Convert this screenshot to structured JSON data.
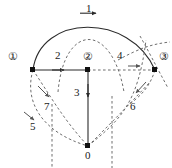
{
  "diagram": {
    "type": "directed-graph",
    "background": "#ffffff",
    "stroke_solid": "#2b2b2b",
    "stroke_dashed": "#6e6e6e",
    "nodes": [
      {
        "id": "n1",
        "label": "①",
        "circled": true,
        "x": 33,
        "y": 70,
        "label_x": 8,
        "label_y": 51
      },
      {
        "id": "n2",
        "label": "②",
        "circled": true,
        "x": 88,
        "y": 70,
        "label_x": 83,
        "label_y": 51
      },
      {
        "id": "n3",
        "label": "③",
        "circled": true,
        "x": 155,
        "y": 70,
        "label_x": 159,
        "label_y": 51
      },
      {
        "id": "n0",
        "label": "0",
        "circled": false,
        "x": 88,
        "y": 146,
        "label_x": 85,
        "label_y": 150
      }
    ],
    "edge_labels": [
      {
        "id": "e1",
        "text": "1",
        "x": 86,
        "y": 3,
        "style": "solid"
      },
      {
        "id": "e2",
        "text": "2",
        "x": 55,
        "y": 50,
        "style": "solid"
      },
      {
        "id": "e3",
        "text": "3",
        "x": 74,
        "y": 87,
        "style": "solid"
      },
      {
        "id": "e4",
        "text": "4",
        "x": 117,
        "y": 50,
        "style": "dashed"
      },
      {
        "id": "e5",
        "text": "5",
        "x": 30,
        "y": 121,
        "style": "dashed"
      },
      {
        "id": "e6",
        "text": "6",
        "x": 130,
        "y": 101,
        "style": "dashed"
      },
      {
        "id": "e7",
        "text": "7",
        "x": 44,
        "y": 101,
        "style": "dashed"
      }
    ]
  }
}
